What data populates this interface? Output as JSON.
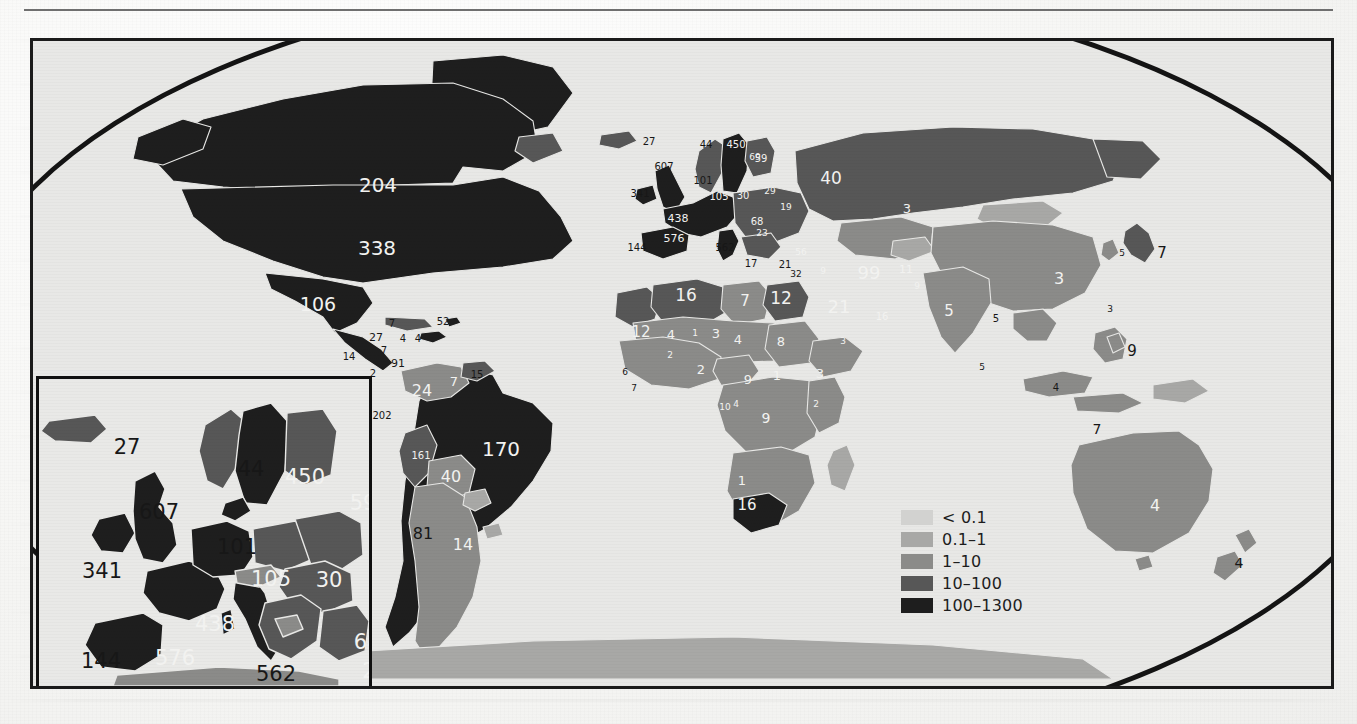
{
  "figure": {
    "type": "choropleth-world-map",
    "projection_outline": "elliptical",
    "background": "#e8e8e6",
    "frame_color": "#1b1b1b"
  },
  "legend": {
    "title": "",
    "position": "center-right",
    "items": [
      {
        "label": "< 0.1",
        "color": "#d2d2d0"
      },
      {
        "label": "0.1–1",
        "color": "#a8a8a6"
      },
      {
        "label": "1–10",
        "color": "#8b8b89"
      },
      {
        "label": "10–100",
        "color": "#575757"
      },
      {
        "label": "100–1300",
        "color": "#1e1e1e"
      }
    ]
  },
  "inset": {
    "name": "europe-inset",
    "region": "Europe",
    "labels": [
      {
        "value": "27",
        "x": 88,
        "y": 68,
        "tone": "dark"
      },
      {
        "value": "44",
        "x": 212,
        "y": 90,
        "tone": "dark"
      },
      {
        "value": "450",
        "x": 266,
        "y": 98,
        "tone": "light"
      },
      {
        "value": "59",
        "x": 324,
        "y": 124,
        "tone": "light"
      },
      {
        "value": "607",
        "x": 120,
        "y": 133,
        "tone": "dark"
      },
      {
        "value": "101",
        "x": 198,
        "y": 168,
        "tone": "dark"
      },
      {
        "value": "341",
        "x": 63,
        "y": 192,
        "tone": "dark"
      },
      {
        "value": "105",
        "x": 232,
        "y": 200,
        "tone": "light"
      },
      {
        "value": "30",
        "x": 290,
        "y": 201,
        "tone": "light"
      },
      {
        "value": "438",
        "x": 176,
        "y": 245,
        "tone": "light"
      },
      {
        "value": "68",
        "x": 328,
        "y": 263,
        "tone": "light"
      },
      {
        "value": "2",
        "x": 330,
        "y": 292,
        "tone": "light"
      },
      {
        "value": "144",
        "x": 62,
        "y": 282,
        "tone": "dark"
      },
      {
        "value": "576",
        "x": 136,
        "y": 279,
        "tone": "light"
      },
      {
        "value": "562",
        "x": 237,
        "y": 295,
        "tone": "dark"
      },
      {
        "value": "17",
        "x": 311,
        "y": 320,
        "tone": "dark"
      }
    ]
  },
  "map": {
    "name": "world-map",
    "labels": [
      {
        "value": "204",
        "x": 345,
        "y": 144,
        "tone": "light",
        "size": 20
      },
      {
        "value": "338",
        "x": 344,
        "y": 207,
        "tone": "light",
        "size": 20
      },
      {
        "value": "106",
        "x": 285,
        "y": 263,
        "tone": "light",
        "size": 19
      },
      {
        "value": "7",
        "x": 359,
        "y": 283,
        "tone": "dark",
        "size": 10
      },
      {
        "value": "52",
        "x": 410,
        "y": 281,
        "tone": "dark",
        "size": 10
      },
      {
        "value": "27",
        "x": 343,
        "y": 296,
        "tone": "dark",
        "size": 11
      },
      {
        "value": "4",
        "x": 370,
        "y": 298,
        "tone": "dark",
        "size": 10
      },
      {
        "value": "4",
        "x": 385,
        "y": 298,
        "tone": "dark",
        "size": 10
      },
      {
        "value": "14",
        "x": 316,
        "y": 316,
        "tone": "dark",
        "size": 10
      },
      {
        "value": "7",
        "x": 351,
        "y": 310,
        "tone": "dark",
        "size": 10
      },
      {
        "value": "91",
        "x": 365,
        "y": 322,
        "tone": "dark",
        "size": 11
      },
      {
        "value": "2",
        "x": 340,
        "y": 333,
        "tone": "dark",
        "size": 10
      },
      {
        "value": "15",
        "x": 444,
        "y": 334,
        "tone": "dark",
        "size": 10
      },
      {
        "value": "24",
        "x": 389,
        "y": 350,
        "tone": "light",
        "size": 16
      },
      {
        "value": "7",
        "x": 421,
        "y": 340,
        "tone": "light",
        "size": 13
      },
      {
        "value": "202",
        "x": 349,
        "y": 375,
        "tone": "dark",
        "size": 10
      },
      {
        "value": "161",
        "x": 388,
        "y": 415,
        "tone": "light",
        "size": 10
      },
      {
        "value": "170",
        "x": 468,
        "y": 408,
        "tone": "light",
        "size": 20
      },
      {
        "value": "40",
        "x": 418,
        "y": 436,
        "tone": "light",
        "size": 16
      },
      {
        "value": "81",
        "x": 390,
        "y": 493,
        "tone": "dark",
        "size": 16
      },
      {
        "value": "14",
        "x": 430,
        "y": 504,
        "tone": "light",
        "size": 16
      },
      {
        "value": "27",
        "x": 616,
        "y": 101,
        "tone": "dark",
        "size": 10
      },
      {
        "value": "44",
        "x": 673,
        "y": 104,
        "tone": "dark",
        "size": 10
      },
      {
        "value": "450",
        "x": 703,
        "y": 104,
        "tone": "light",
        "size": 10
      },
      {
        "value": "69",
        "x": 722,
        "y": 116,
        "tone": "light",
        "size": 9
      },
      {
        "value": "607",
        "x": 631,
        "y": 126,
        "tone": "dark",
        "size": 10
      },
      {
        "value": "59",
        "x": 728,
        "y": 118,
        "tone": "light",
        "size": 10
      },
      {
        "value": "101",
        "x": 670,
        "y": 140,
        "tone": "dark",
        "size": 10
      },
      {
        "value": "341",
        "x": 607,
        "y": 153,
        "tone": "dark",
        "size": 10
      },
      {
        "value": "105",
        "x": 686,
        "y": 156,
        "tone": "light",
        "size": 10
      },
      {
        "value": "30",
        "x": 710,
        "y": 155,
        "tone": "light",
        "size": 10
      },
      {
        "value": "29",
        "x": 737,
        "y": 150,
        "tone": "light",
        "size": 9
      },
      {
        "value": "19",
        "x": 753,
        "y": 166,
        "tone": "light",
        "size": 9
      },
      {
        "value": "40",
        "x": 798,
        "y": 137,
        "tone": "light",
        "size": 17
      },
      {
        "value": "3",
        "x": 874,
        "y": 167,
        "tone": "light",
        "size": 13
      },
      {
        "value": "438",
        "x": 645,
        "y": 177,
        "tone": "light",
        "size": 11
      },
      {
        "value": "68",
        "x": 724,
        "y": 181,
        "tone": "light",
        "size": 10
      },
      {
        "value": "23",
        "x": 729,
        "y": 192,
        "tone": "light",
        "size": 9
      },
      {
        "value": "144",
        "x": 604,
        "y": 207,
        "tone": "dark",
        "size": 10
      },
      {
        "value": "576",
        "x": 641,
        "y": 197,
        "tone": "light",
        "size": 11
      },
      {
        "value": "562",
        "x": 692,
        "y": 207,
        "tone": "dark",
        "size": 10
      },
      {
        "value": "56",
        "x": 768,
        "y": 211,
        "tone": "light",
        "size": 9
      },
      {
        "value": "17",
        "x": 718,
        "y": 223,
        "tone": "dark",
        "size": 10
      },
      {
        "value": "21",
        "x": 752,
        "y": 224,
        "tone": "dark",
        "size": 10
      },
      {
        "value": "32",
        "x": 763,
        "y": 233,
        "tone": "dark",
        "size": 9
      },
      {
        "value": "9",
        "x": 790,
        "y": 230,
        "tone": "light",
        "size": 9
      },
      {
        "value": "99",
        "x": 836,
        "y": 232,
        "tone": "light",
        "size": 18
      },
      {
        "value": "11",
        "x": 873,
        "y": 228,
        "tone": "light",
        "size": 11
      },
      {
        "value": "9",
        "x": 884,
        "y": 245,
        "tone": "light",
        "size": 9
      },
      {
        "value": "21",
        "x": 806,
        "y": 266,
        "tone": "light",
        "size": 18
      },
      {
        "value": "16",
        "x": 849,
        "y": 276,
        "tone": "light",
        "size": 10
      },
      {
        "value": "5",
        "x": 916,
        "y": 270,
        "tone": "light",
        "size": 15
      },
      {
        "value": "5",
        "x": 963,
        "y": 278,
        "tone": "dark",
        "size": 10
      },
      {
        "value": "3",
        "x": 1026,
        "y": 238,
        "tone": "light",
        "size": 16
      },
      {
        "value": "5",
        "x": 1089,
        "y": 212,
        "tone": "dark",
        "size": 9
      },
      {
        "value": "7",
        "x": 1129,
        "y": 212,
        "tone": "dark",
        "size": 15
      },
      {
        "value": "3",
        "x": 1077,
        "y": 268,
        "tone": "dark",
        "size": 9
      },
      {
        "value": "9",
        "x": 1099,
        "y": 310,
        "tone": "dark",
        "size": 15
      },
      {
        "value": "5",
        "x": 949,
        "y": 326,
        "tone": "dark",
        "size": 9
      },
      {
        "value": "4",
        "x": 1023,
        "y": 347,
        "tone": "dark",
        "size": 10
      },
      {
        "value": "7",
        "x": 1064,
        "y": 388,
        "tone": "dark",
        "size": 14
      },
      {
        "value": "4",
        "x": 1122,
        "y": 465,
        "tone": "light",
        "size": 16
      },
      {
        "value": "4",
        "x": 1206,
        "y": 522,
        "tone": "dark",
        "size": 14
      },
      {
        "value": "16",
        "x": 653,
        "y": 254,
        "tone": "light",
        "size": 17
      },
      {
        "value": "7",
        "x": 712,
        "y": 260,
        "tone": "light",
        "size": 15
      },
      {
        "value": "12",
        "x": 748,
        "y": 257,
        "tone": "light",
        "size": 17
      },
      {
        "value": "12",
        "x": 608,
        "y": 291,
        "tone": "light",
        "size": 15
      },
      {
        "value": "4",
        "x": 638,
        "y": 293,
        "tone": "light",
        "size": 13
      },
      {
        "value": "3",
        "x": 683,
        "y": 292,
        "tone": "light",
        "size": 13
      },
      {
        "value": "4",
        "x": 705,
        "y": 298,
        "tone": "light",
        "size": 13
      },
      {
        "value": "8",
        "x": 748,
        "y": 300,
        "tone": "light",
        "size": 13
      },
      {
        "value": "1",
        "x": 662,
        "y": 292,
        "tone": "light",
        "size": 9
      },
      {
        "value": "2",
        "x": 637,
        "y": 314,
        "tone": "light",
        "size": 9
      },
      {
        "value": "2",
        "x": 668,
        "y": 328,
        "tone": "light",
        "size": 13
      },
      {
        "value": "9",
        "x": 715,
        "y": 338,
        "tone": "light",
        "size": 13
      },
      {
        "value": "1",
        "x": 744,
        "y": 334,
        "tone": "light",
        "size": 13
      },
      {
        "value": "3",
        "x": 787,
        "y": 332,
        "tone": "light",
        "size": 13
      },
      {
        "value": "3",
        "x": 810,
        "y": 300,
        "tone": "light",
        "size": 9
      },
      {
        "value": "6",
        "x": 592,
        "y": 331,
        "tone": "dark",
        "size": 9
      },
      {
        "value": "7",
        "x": 601,
        "y": 347,
        "tone": "dark",
        "size": 9
      },
      {
        "value": "10",
        "x": 692,
        "y": 366,
        "tone": "light",
        "size": 9
      },
      {
        "value": "4",
        "x": 703,
        "y": 363,
        "tone": "light",
        "size": 9
      },
      {
        "value": "9",
        "x": 733,
        "y": 377,
        "tone": "light",
        "size": 14
      },
      {
        "value": "2",
        "x": 783,
        "y": 363,
        "tone": "light",
        "size": 9
      },
      {
        "value": "1",
        "x": 709,
        "y": 439,
        "tone": "light",
        "size": 13
      },
      {
        "value": "16",
        "x": 714,
        "y": 464,
        "tone": "light",
        "size": 15
      }
    ]
  }
}
